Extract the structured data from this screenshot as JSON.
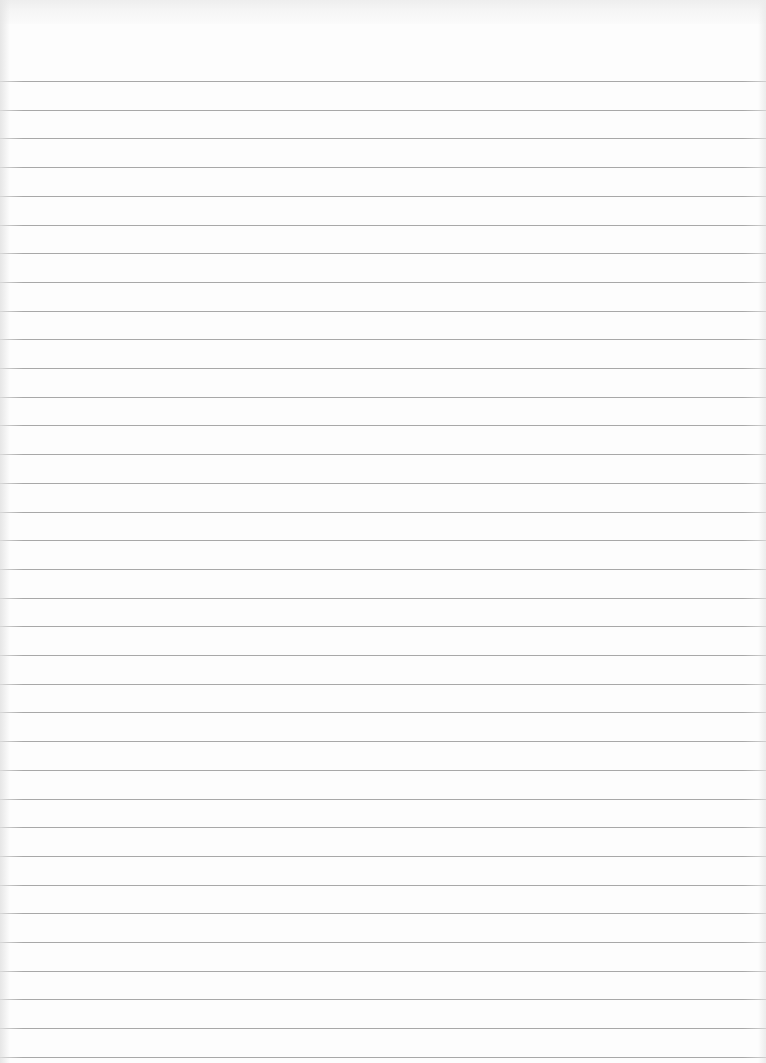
{
  "page": {
    "type": "lined-paper",
    "background_color": "#fdfdfd",
    "line_color": "#9a9a9a",
    "first_line_y": 81,
    "line_spacing": 28.7,
    "line_count": 35
  }
}
